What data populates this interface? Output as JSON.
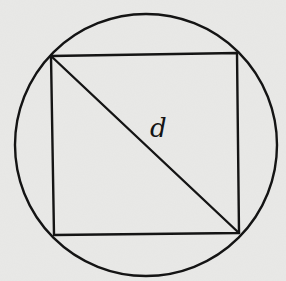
{
  "diagram": {
    "shapes": [
      "circle",
      "square",
      "diagonal"
    ],
    "diagonal_label": "d",
    "colors": {
      "background": "#e9e9e7",
      "ink": "#141414"
    }
  }
}
